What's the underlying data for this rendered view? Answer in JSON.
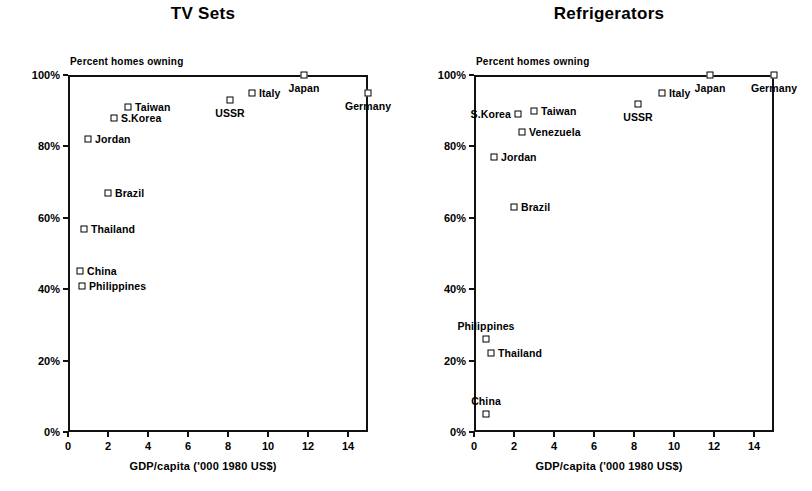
{
  "figure": {
    "xaxis_title": "GDP/capita ('000 1980 US$)",
    "yaxis_title": "Percent homes owning",
    "x_ticks": [
      "0",
      "2",
      "4",
      "6",
      "8",
      "10",
      "12",
      "14"
    ],
    "y_ticks": [
      "0%",
      "20%",
      "40%",
      "60%",
      "80%",
      "100%"
    ]
  },
  "chart_data": [
    {
      "type": "scatter",
      "title": "TV Sets",
      "xlabel": "GDP/capita ('000 1980 US$)",
      "ylabel": "Percent homes owning",
      "xlim": [
        0,
        15
      ],
      "ylim": [
        0,
        100
      ],
      "xticks": [
        0,
        2,
        4,
        6,
        8,
        10,
        12,
        14
      ],
      "yticks": [
        0,
        20,
        40,
        60,
        80,
        100
      ],
      "grid": false,
      "legend": "none",
      "points": [
        {
          "label": "Japan",
          "x": 11.8,
          "y": 100,
          "label_pos": "below"
        },
        {
          "label": "Germany",
          "x": 15.0,
          "y": 95,
          "label_pos": "below"
        },
        {
          "label": "Italy",
          "x": 9.2,
          "y": 95,
          "label_pos": "right"
        },
        {
          "label": "USSR",
          "x": 8.1,
          "y": 93,
          "label_pos": "below"
        },
        {
          "label": "Taiwan",
          "x": 3.0,
          "y": 91,
          "label_pos": "right"
        },
        {
          "label": "S.Korea",
          "x": 2.3,
          "y": 88,
          "label_pos": "right"
        },
        {
          "label": "Jordan",
          "x": 1.0,
          "y": 82,
          "label_pos": "right"
        },
        {
          "label": "Brazil",
          "x": 2.0,
          "y": 67,
          "label_pos": "right"
        },
        {
          "label": "Thailand",
          "x": 0.8,
          "y": 57,
          "label_pos": "right"
        },
        {
          "label": "China",
          "x": 0.6,
          "y": 45,
          "label_pos": "right"
        },
        {
          "label": "Philippines",
          "x": 0.7,
          "y": 41,
          "label_pos": "right"
        }
      ]
    },
    {
      "type": "scatter",
      "title": "Refrigerators",
      "xlabel": "GDP/capita ('000 1980 US$)",
      "ylabel": "Percent homes owning",
      "xlim": [
        0,
        15
      ],
      "ylim": [
        0,
        100
      ],
      "xticks": [
        0,
        2,
        4,
        6,
        8,
        10,
        12,
        14
      ],
      "yticks": [
        0,
        20,
        40,
        60,
        80,
        100
      ],
      "grid": false,
      "legend": "none",
      "points": [
        {
          "label": "Japan",
          "x": 11.8,
          "y": 100,
          "label_pos": "below"
        },
        {
          "label": "Germany",
          "x": 15.0,
          "y": 100,
          "label_pos": "below"
        },
        {
          "label": "Italy",
          "x": 9.4,
          "y": 95,
          "label_pos": "right"
        },
        {
          "label": "USSR",
          "x": 8.2,
          "y": 92,
          "label_pos": "below"
        },
        {
          "label": "Taiwan",
          "x": 3.0,
          "y": 90,
          "label_pos": "right"
        },
        {
          "label": "S.Korea",
          "x": 2.2,
          "y": 89,
          "label_pos": "left"
        },
        {
          "label": "Venezuela",
          "x": 2.4,
          "y": 84,
          "label_pos": "right"
        },
        {
          "label": "Jordan",
          "x": 1.0,
          "y": 77,
          "label_pos": "right"
        },
        {
          "label": "Brazil",
          "x": 2.0,
          "y": 63,
          "label_pos": "right"
        },
        {
          "label": "Philippines",
          "x": 0.6,
          "y": 26,
          "label_pos": "above"
        },
        {
          "label": "Thailand",
          "x": 0.85,
          "y": 22,
          "label_pos": "right"
        },
        {
          "label": "China",
          "x": 0.6,
          "y": 5,
          "label_pos": "above"
        }
      ]
    }
  ]
}
